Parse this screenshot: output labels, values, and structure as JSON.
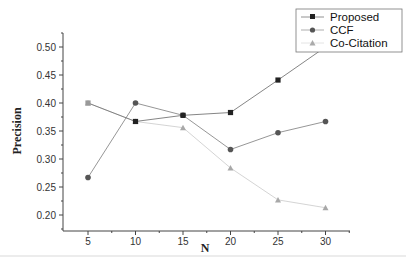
{
  "chart_data": {
    "type": "line",
    "title": "",
    "xlabel": "N",
    "ylabel": "Precision",
    "x": [
      5,
      10,
      15,
      20,
      25,
      30
    ],
    "xticks": [
      "5",
      "10",
      "15",
      "20",
      "25",
      "30"
    ],
    "yticks": [
      "0.20",
      "0.25",
      "0.30",
      "0.35",
      "0.40",
      "0.45",
      "0.50"
    ],
    "xlim": [
      3,
      32.5
    ],
    "ylim": [
      0.175,
      0.525
    ],
    "grid": false,
    "legend_position": "top-right",
    "series": [
      {
        "name": "Proposed",
        "marker": "square",
        "color": "#222222",
        "line_color": "#777777",
        "values": [
          0.4,
          0.367,
          0.378,
          0.383,
          0.441,
          0.5
        ]
      },
      {
        "name": "CCF",
        "marker": "circle",
        "color": "#555555",
        "line_color": "#8a8a8a",
        "values": [
          0.267,
          0.4,
          0.378,
          0.317,
          0.347,
          0.367
        ]
      },
      {
        "name": "Co-Citation",
        "marker": "triangle",
        "color": "#a8a8a8",
        "line_color": "#cfcfcf",
        "values": [
          0.4,
          0.367,
          0.356,
          0.284,
          0.227,
          0.213
        ]
      }
    ]
  },
  "legend": {
    "items": [
      "Proposed",
      "CCF",
      "Co-Citation"
    ]
  },
  "axes": {
    "x_title": "N",
    "y_title": "Precision"
  }
}
